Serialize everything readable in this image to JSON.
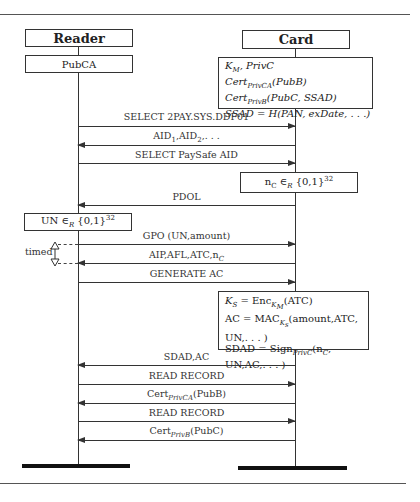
{
  "participants": {
    "reader": {
      "name": "Reader",
      "state": "PubCA"
    },
    "card": {
      "name": "Card",
      "state_lines": [
        "K_M, PrivC",
        "Cert_PrivCA(PubB)",
        "Cert_PrivB(PubC, SSAD)",
        "SSAD = H(PAN, exDate, ...)"
      ]
    }
  },
  "messages": [
    {
      "id": "m1",
      "label": "SELECT 2PAY.SYS.DDF01",
      "direction": "reader-to-card"
    },
    {
      "id": "m2",
      "label": "AID1,AID2,...",
      "direction": "card-to-reader"
    },
    {
      "id": "m3",
      "label": "SELECT PaySafe AID",
      "direction": "reader-to-card"
    },
    {
      "id": "m4",
      "label": "PDOL",
      "direction": "card-to-reader"
    },
    {
      "id": "m5",
      "label": "GPO (UN,amount)",
      "direction": "reader-to-card"
    },
    {
      "id": "m6",
      "label": "AIP,AFL,ATC,nC",
      "direction": "card-to-reader"
    },
    {
      "id": "m7",
      "label": "GENERATE AC",
      "direction": "reader-to-card"
    },
    {
      "id": "m8",
      "label": "SDAD,AC",
      "direction": "card-to-reader"
    },
    {
      "id": "m9",
      "label": "READ RECORD",
      "direction": "reader-to-card"
    },
    {
      "id": "m10",
      "label": "Cert_PrivCA(PubB)",
      "direction": "card-to-reader"
    },
    {
      "id": "m11",
      "label": "READ RECORD",
      "direction": "reader-to-card"
    },
    {
      "id": "m12",
      "label": "Cert_PrivB(PubC)",
      "direction": "card-to-reader"
    }
  ],
  "actions": {
    "card_nonce": "nC ∈R {0,1}^32",
    "reader_nonce": "UN ∈R {0,1}^32",
    "card_compute_lines": [
      "KS = Enc_KM(ATC)",
      "AC = MAC_Ks(amount,ATC,",
      "UN,...)",
      "SDAD = Sign_PrivC(nC,",
      "UN,AC,...)"
    ]
  },
  "annotations": {
    "timed_label": "timed"
  },
  "text": {
    "reader": "Reader",
    "pubca": "PubCA",
    "card": "Card",
    "m1": "SELECT 2PAY.SYS.DDF01",
    "m3": "SELECT PaySafe AID",
    "m4": "PDOL",
    "m5": "GPO (UN,amount)",
    "m7": "GENERATE AC",
    "m8": "SDAD,AC",
    "m9": "READ RECORD",
    "m11": "READ RECORD",
    "timed": "timed"
  }
}
